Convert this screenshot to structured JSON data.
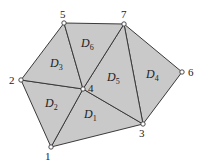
{
  "diagram": {
    "colors": {
      "fill": "#c9c9c9",
      "stroke": "#3a3a3a",
      "vertex_fill": "#ffffff"
    },
    "vertices": [
      {
        "id": "1",
        "label": "1",
        "x": 51,
        "y": 147,
        "lx": 45,
        "ly": 160
      },
      {
        "id": "2",
        "label": "2",
        "x": 21,
        "y": 80,
        "lx": 9,
        "ly": 84
      },
      {
        "id": "3",
        "label": "3",
        "x": 143,
        "y": 124,
        "lx": 139,
        "ly": 137
      },
      {
        "id": "4",
        "label": "4",
        "x": 83,
        "y": 89,
        "lx": 88,
        "ly": 92
      },
      {
        "id": "5",
        "label": "5",
        "x": 64,
        "y": 23,
        "lx": 60,
        "ly": 18
      },
      {
        "id": "6",
        "label": "6",
        "x": 182,
        "y": 72,
        "lx": 188,
        "ly": 76
      },
      {
        "id": "7",
        "label": "7",
        "x": 124,
        "y": 24,
        "lx": 121,
        "ly": 18
      }
    ],
    "regions": [
      {
        "id": "D1",
        "letter": "D",
        "sub": "1",
        "vertices": [
          "1",
          "4",
          "3"
        ],
        "lx": 84,
        "ly": 118
      },
      {
        "id": "D2",
        "letter": "D",
        "sub": "2",
        "vertices": [
          "2",
          "4",
          "1"
        ],
        "lx": 45,
        "ly": 107
      },
      {
        "id": "D3",
        "letter": "D",
        "sub": "3",
        "vertices": [
          "2",
          "5",
          "4"
        ],
        "lx": 50,
        "ly": 67
      },
      {
        "id": "D4",
        "letter": "D",
        "sub": "4",
        "vertices": [
          "7",
          "6",
          "3"
        ],
        "lx": 146,
        "ly": 78
      },
      {
        "id": "D5",
        "letter": "D",
        "sub": "5",
        "vertices": [
          "7",
          "3",
          "4"
        ],
        "lx": 107,
        "ly": 81
      },
      {
        "id": "D6",
        "letter": "D",
        "sub": "6",
        "vertices": [
          "5",
          "7",
          "4"
        ],
        "lx": 81,
        "ly": 47
      }
    ]
  }
}
